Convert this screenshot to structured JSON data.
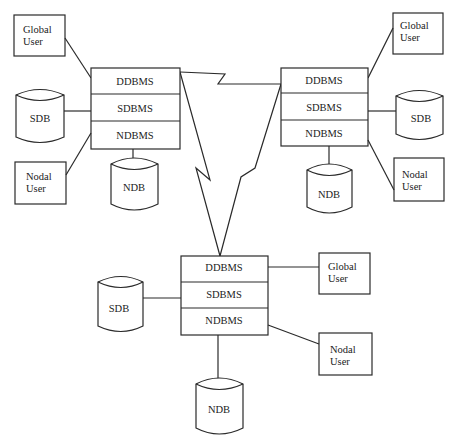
{
  "diagram": {
    "type": "distributed-database-architecture",
    "sites": [
      {
        "id": "site-left",
        "dbms_layers": [
          "DDBMS",
          "SDBMS",
          "NDBMS"
        ],
        "global_user": "Global User",
        "nodal_user": "Nodal User",
        "system_db": "SDB",
        "nodal_db": "NDB"
      },
      {
        "id": "site-right",
        "dbms_layers": [
          "DDBMS",
          "SDBMS",
          "NDBMS"
        ],
        "global_user": "Global User",
        "nodal_user": "Nodal User",
        "system_db": "SDB",
        "nodal_db": "NDB"
      },
      {
        "id": "site-bottom",
        "dbms_layers": [
          "DDBMS",
          "SDBMS",
          "NDBMS"
        ],
        "global_user": "Global User",
        "nodal_user": "Nodal User",
        "system_db": "SDB",
        "nodal_db": "NDB"
      }
    ],
    "labels": {
      "global_line1": "Global",
      "global_line2": "User",
      "nodal_line1": "Nodal",
      "nodal_line2": "User",
      "sdb": "SDB",
      "ndb": "NDB",
      "ddbms": "DDBMS",
      "sdbms": "SDBMS",
      "ndbms": "NDBMS"
    },
    "links": [
      {
        "from": "site-left.DDBMS",
        "to": "site-right.DDBMS",
        "style": "lightning"
      },
      {
        "from": "site-left.DDBMS",
        "to": "site-bottom.DDBMS",
        "style": "lightning"
      },
      {
        "from": "site-right.DDBMS",
        "to": "site-bottom.DDBMS",
        "style": "lightning"
      }
    ]
  }
}
